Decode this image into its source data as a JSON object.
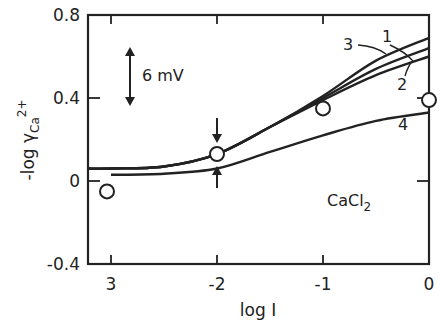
{
  "chart_data": {
    "type": "line",
    "title": "",
    "xlabel": "log I",
    "ylabel": "-log γCa2+",
    "ylabel_parts": {
      "main": "-log γ",
      "sub": "Ca",
      "sup": "2+"
    },
    "xlim": [
      -3.2,
      0
    ],
    "ylim": [
      -0.4,
      0.8
    ],
    "x_ticks": [
      -3,
      -2,
      -1,
      0
    ],
    "x_tick_labels": [
      "3",
      "-2",
      "-1",
      "0"
    ],
    "y_ticks": [
      0.8,
      0.4,
      0,
      -0.4
    ],
    "y_tick_labels": [
      "0.8",
      "0.4",
      "0",
      "-0.4"
    ],
    "grid": false,
    "legend": "none (curves labeled inline 1–4)",
    "series": [
      {
        "name": "1",
        "x": [
          -3.2,
          -3,
          -2.5,
          -2,
          -1.5,
          -1,
          -0.5,
          0
        ],
        "y": [
          0.06,
          0.06,
          0.07,
          0.13,
          0.26,
          0.41,
          0.58,
          0.69
        ]
      },
      {
        "name": "3",
        "x": [
          -3.2,
          -3,
          -2.5,
          -2,
          -1.5,
          -1,
          -0.5,
          0
        ],
        "y": [
          0.06,
          0.06,
          0.07,
          0.13,
          0.26,
          0.4,
          0.54,
          0.64
        ]
      },
      {
        "name": "2",
        "x": [
          -3.2,
          -3,
          -2.5,
          -2,
          -1.5,
          -1,
          -0.5,
          0
        ],
        "y": [
          0.06,
          0.06,
          0.07,
          0.13,
          0.26,
          0.39,
          0.51,
          0.6
        ]
      },
      {
        "name": "4",
        "x": [
          -3,
          -2.5,
          -2,
          -1.5,
          -1,
          -0.5,
          0
        ],
        "y": [
          0.03,
          0.035,
          0.06,
          0.14,
          0.22,
          0.29,
          0.33
        ]
      },
      {
        "name": "experimental",
        "type": "scatter",
        "x": [
          -3,
          -2,
          -1,
          0
        ],
        "y": [
          -0.05,
          0.13,
          0.35,
          0.39
        ]
      }
    ],
    "annotations": [
      {
        "text": "6 mV",
        "kind": "vertical scale bar",
        "x": -2.85,
        "y_range": [
          0.47,
          0.73
        ]
      },
      {
        "text": "CaCl2",
        "x": -0.62,
        "y": 0.02
      },
      {
        "text": "↓",
        "kind": "arrow pointing to data at log I = -2 (upper)"
      },
      {
        "text": "↑",
        "kind": "arrow pointing to curve 4 at log I = -2"
      }
    ]
  },
  "labels": {
    "scale_bar": "6 mV",
    "salt_main": "CaCl",
    "salt_sub": "2",
    "curve_1": "1",
    "curve_2": "2",
    "curve_3": "3",
    "curve_4": "4"
  }
}
